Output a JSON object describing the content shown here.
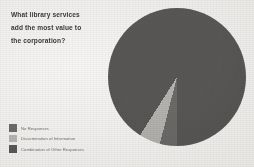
{
  "slide": {
    "background_color": "#f0efed",
    "title_lines": [
      "What library services",
      "add the most value to",
      "the corporation?"
    ],
    "title_full": "What library services add the most value to the corporation?"
  },
  "legend": {
    "items": [
      {
        "label": "No Responses",
        "color": "#6b6a68",
        "swatch_name": "legend-swatch-no-responses"
      },
      {
        "label": "Dissemination of Information",
        "color": "#b4b3b0",
        "swatch_name": "legend-swatch-dissemination"
      },
      {
        "label": "Combination of Other Responses",
        "color": "#585755",
        "swatch_name": "legend-swatch-combination"
      }
    ]
  },
  "chart_data": {
    "type": "pie",
    "title": "What library services add the most value to the corporation?",
    "legend_position": "bottom-left",
    "labels": [
      "No Responses",
      "Dissemination of Information",
      "Combination of Other Responses"
    ],
    "values": [
      4,
      5,
      91
    ],
    "unit": "percent",
    "colors": [
      "#6b6a68",
      "#b4b3b0",
      "#585755"
    ],
    "start_angle_deg": 180,
    "direction": "clockwise"
  }
}
